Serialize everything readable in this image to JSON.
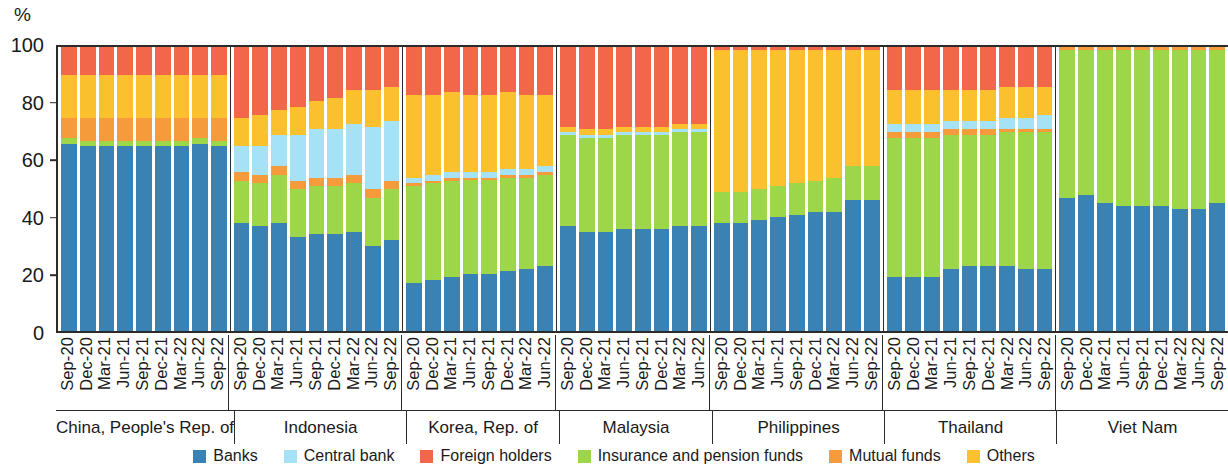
{
  "axis": {
    "unit_label": "%",
    "y_ticks": [
      0,
      20,
      40,
      60,
      80,
      100
    ],
    "y_min": 0,
    "y_max": 100
  },
  "legend": {
    "items": [
      {
        "label": "Banks",
        "color": "#3b82b4",
        "key": "banks"
      },
      {
        "label": "Central bank",
        "color": "#a5e2f5",
        "key": "central_bank"
      },
      {
        "label": "Foreign holders",
        "color": "#f2674a",
        "key": "foreign_holders"
      },
      {
        "label": "Insurance and pension funds",
        "color": "#9dd648",
        "key": "insurance_pension"
      },
      {
        "label": "Mutual funds",
        "color": "#f59b3c",
        "key": "mutual_funds"
      },
      {
        "label": "Others",
        "color": "#fbc02d",
        "key": "others"
      }
    ]
  },
  "chart_data": {
    "type": "bar",
    "stacked": true,
    "title": "",
    "xlabel": "",
    "ylabel": "%",
    "ylim": [
      0,
      100
    ],
    "grid": false,
    "legend_position": "bottom",
    "stack_order": [
      "banks",
      "insurance_pension",
      "mutual_funds",
      "central_bank",
      "others",
      "foreign_holders"
    ],
    "series_colors": {
      "banks": "#3b82b4",
      "central_bank": "#a5e2f5",
      "foreign_holders": "#f2674a",
      "insurance_pension": "#9dd648",
      "mutual_funds": "#f59b3c",
      "others": "#fbc02d"
    },
    "panels": [
      {
        "name": "China, People's Rep. of",
        "categories": [
          "Sep-20",
          "Dec-20",
          "Mar-21",
          "Jun-21",
          "Sep-21",
          "Dec-21",
          "Mar-22",
          "Jun-22",
          "Sep-22"
        ],
        "series": [
          {
            "name": "Banks",
            "key": "banks",
            "values": [
              66,
              65,
              65,
              65,
              65,
              65,
              65,
              66,
              65
            ]
          },
          {
            "name": "Insurance and pension funds",
            "key": "insurance_pension",
            "values": [
              2,
              2,
              2,
              2,
              2,
              2,
              2,
              2,
              2
            ]
          },
          {
            "name": "Mutual funds",
            "key": "mutual_funds",
            "values": [
              7,
              8,
              8,
              8,
              8,
              8,
              8,
              7,
              8
            ]
          },
          {
            "name": "Central bank",
            "key": "central_bank",
            "values": [
              0,
              0,
              0,
              0,
              0,
              0,
              0,
              0,
              0
            ]
          },
          {
            "name": "Others",
            "key": "others",
            "values": [
              15,
              15,
              15,
              15,
              15,
              15,
              15,
              15,
              15
            ]
          },
          {
            "name": "Foreign holders",
            "key": "foreign_holders",
            "values": [
              10,
              10,
              10,
              10,
              10,
              10,
              10,
              10,
              10
            ]
          }
        ]
      },
      {
        "name": "Indonesia",
        "categories": [
          "Sep-20",
          "Dec-20",
          "Mar-21",
          "Jun-21",
          "Sep-21",
          "Dec-21",
          "Mar-22",
          "Jun-22",
          "Sep-22"
        ],
        "series": [
          {
            "name": "Banks",
            "key": "banks",
            "values": [
              38,
              37,
              38,
              33,
              34,
              34,
              35,
              30,
              32
            ]
          },
          {
            "name": "Insurance and pension funds",
            "key": "insurance_pension",
            "values": [
              15,
              15,
              17,
              17,
              17,
              17,
              17,
              17,
              18
            ]
          },
          {
            "name": "Mutual funds",
            "key": "mutual_funds",
            "values": [
              3,
              3,
              3,
              3,
              3,
              3,
              3,
              3,
              3
            ]
          },
          {
            "name": "Central bank",
            "key": "central_bank",
            "values": [
              9,
              10,
              11,
              16,
              17,
              17,
              18,
              22,
              21
            ]
          },
          {
            "name": "Others",
            "key": "others",
            "values": [
              10,
              11,
              9,
              10,
              10,
              11,
              12,
              13,
              12
            ]
          },
          {
            "name": "Foreign holders",
            "key": "foreign_holders",
            "values": [
              25,
              24,
              22,
              21,
              19,
              18,
              15,
              15,
              14
            ]
          }
        ]
      },
      {
        "name": "Korea, Rep. of",
        "categories": [
          "Sep-20",
          "Dec-20",
          "Mar-21",
          "Jun-21",
          "Sep-21",
          "Dec-21",
          "Mar-22",
          "Jun-22"
        ],
        "series": [
          {
            "name": "Banks",
            "key": "banks",
            "values": [
              17,
              18,
              19,
              20,
              20,
              21,
              22,
              23
            ]
          },
          {
            "name": "Insurance and pension funds",
            "key": "insurance_pension",
            "values": [
              34,
              34,
              34,
              33,
              33,
              33,
              32,
              32
            ]
          },
          {
            "name": "Mutual funds",
            "key": "mutual_funds",
            "values": [
              1,
              1,
              1,
              1,
              1,
              1,
              1,
              1
            ]
          },
          {
            "name": "Central bank",
            "key": "central_bank",
            "values": [
              2,
              2,
              2,
              2,
              2,
              2,
              2,
              2
            ]
          },
          {
            "name": "Others",
            "key": "others",
            "values": [
              29,
              28,
              28,
              27,
              27,
              27,
              26,
              25
            ]
          },
          {
            "name": "Foreign holders",
            "key": "foreign_holders",
            "values": [
              17,
              17,
              16,
              17,
              17,
              16,
              17,
              17
            ]
          }
        ]
      },
      {
        "name": "Malaysia",
        "categories": [
          "Sep-20",
          "Dec-20",
          "Mar-21",
          "Jun-21",
          "Sep-21",
          "Dec-21",
          "Mar-22",
          "Jun-22"
        ],
        "series": [
          {
            "name": "Banks",
            "key": "banks",
            "values": [
              37,
              35,
              35,
              36,
              36,
              36,
              37,
              37
            ]
          },
          {
            "name": "Insurance and pension funds",
            "key": "insurance_pension",
            "values": [
              32,
              33,
              33,
              33,
              33,
              33,
              33,
              33
            ]
          },
          {
            "name": "Mutual funds",
            "key": "mutual_funds",
            "values": [
              0,
              0,
              0,
              0,
              0,
              0,
              0,
              0
            ]
          },
          {
            "name": "Central bank",
            "key": "central_bank",
            "values": [
              1,
              1,
              1,
              1,
              1,
              1,
              1,
              1
            ]
          },
          {
            "name": "Others",
            "key": "others",
            "values": [
              2,
              2,
              2,
              2,
              2,
              2,
              2,
              2
            ]
          },
          {
            "name": "Foreign holders",
            "key": "foreign_holders",
            "values": [
              28,
              29,
              29,
              28,
              28,
              28,
              27,
              27
            ]
          }
        ]
      },
      {
        "name": "Philippines",
        "categories": [
          "Sep-20",
          "Dec-20",
          "Mar-21",
          "Jun-21",
          "Sep-21",
          "Dec-21",
          "Mar-22",
          "Jun-22",
          "Sep-22"
        ],
        "series": [
          {
            "name": "Banks",
            "key": "banks",
            "values": [
              38,
              38,
              39,
              40,
              41,
              42,
              42,
              46,
              46
            ]
          },
          {
            "name": "Insurance and pension funds",
            "key": "insurance_pension",
            "values": [
              11,
              11,
              11,
              11,
              11,
              11,
              12,
              12,
              12
            ]
          },
          {
            "name": "Mutual funds",
            "key": "mutual_funds",
            "values": [
              0,
              0,
              0,
              0,
              0,
              0,
              0,
              0,
              0
            ]
          },
          {
            "name": "Central bank",
            "key": "central_bank",
            "values": [
              0,
              0,
              0,
              0,
              0,
              0,
              0,
              0,
              0
            ]
          },
          {
            "name": "Others",
            "key": "others",
            "values": [
              50,
              50,
              49,
              48,
              47,
              46,
              45,
              41,
              41
            ]
          },
          {
            "name": "Foreign holders",
            "key": "foreign_holders",
            "values": [
              1,
              1,
              1,
              1,
              1,
              1,
              1,
              1,
              1
            ]
          }
        ]
      },
      {
        "name": "Thailand",
        "categories": [
          "Sep-20",
          "Dec-20",
          "Mar-21",
          "Jun-21",
          "Sep-21",
          "Dec-21",
          "Mar-22",
          "Jun-22",
          "Sep-22"
        ],
        "series": [
          {
            "name": "Banks",
            "key": "banks",
            "values": [
              19,
              19,
              19,
              22,
              23,
              23,
              23,
              22,
              22
            ]
          },
          {
            "name": "Insurance and pension funds",
            "key": "insurance_pension",
            "values": [
              49,
              49,
              49,
              47,
              46,
              46,
              47,
              48,
              48
            ]
          },
          {
            "name": "Mutual funds",
            "key": "mutual_funds",
            "values": [
              2,
              2,
              2,
              2,
              2,
              2,
              1,
              1,
              1
            ]
          },
          {
            "name": "Central bank",
            "key": "central_bank",
            "values": [
              3,
              3,
              3,
              3,
              3,
              3,
              4,
              4,
              5
            ]
          },
          {
            "name": "Others",
            "key": "others",
            "values": [
              12,
              12,
              12,
              11,
              11,
              11,
              11,
              11,
              10
            ]
          },
          {
            "name": "Foreign holders",
            "key": "foreign_holders",
            "values": [
              15,
              15,
              15,
              15,
              15,
              15,
              14,
              14,
              14
            ]
          }
        ]
      },
      {
        "name": "Viet Nam",
        "categories": [
          "Sep-20",
          "Dec-20",
          "Mar-21",
          "Jun-21",
          "Sep-21",
          "Dec-21",
          "Mar-22",
          "Jun-22",
          "Sep-22"
        ],
        "series": [
          {
            "name": "Banks",
            "key": "banks",
            "values": [
              47,
              48,
              45,
              44,
              44,
              44,
              43,
              43,
              45
            ]
          },
          {
            "name": "Insurance and pension funds",
            "key": "insurance_pension",
            "values": [
              52,
              51,
              54,
              55,
              55,
              55,
              56,
              56,
              54
            ]
          },
          {
            "name": "Mutual funds",
            "key": "mutual_funds",
            "values": [
              1,
              1,
              1,
              1,
              1,
              1,
              1,
              1,
              1
            ]
          },
          {
            "name": "Central bank",
            "key": "central_bank",
            "values": [
              0,
              0,
              0,
              0,
              0,
              0,
              0,
              0,
              0
            ]
          },
          {
            "name": "Others",
            "key": "others",
            "values": [
              0,
              0,
              0,
              0,
              0,
              0,
              0,
              0,
              0
            ]
          },
          {
            "name": "Foreign holders",
            "key": "foreign_holders",
            "values": [
              0,
              0,
              0,
              0,
              0,
              0,
              0,
              0,
              0
            ]
          }
        ]
      }
    ]
  }
}
